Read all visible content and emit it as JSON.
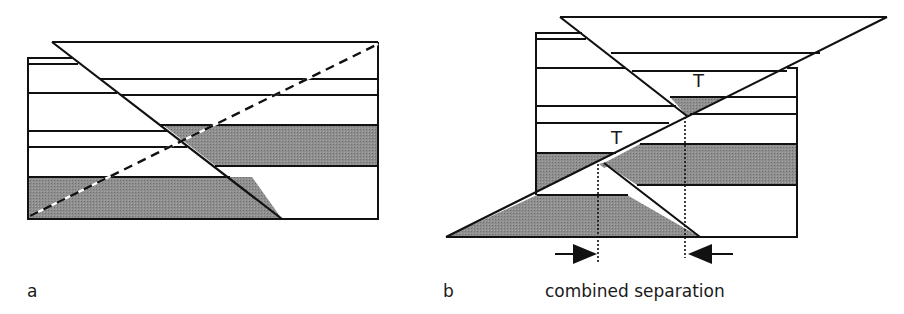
{
  "figure": {
    "panels": [
      {
        "id": "a",
        "label": "a",
        "description": "Normal fault cutting horizontal strata with dashed inclined marker line"
      },
      {
        "id": "b",
        "label": "b",
        "description": "Normal fault and thrust fault intersecting strata, showing combined separation",
        "annotations": [
          "T",
          "T"
        ],
        "caption": "combined separation"
      }
    ],
    "colors": {
      "line": "#111111",
      "fill_shaded": "#8a8a8a",
      "background": "#ffffff"
    }
  }
}
